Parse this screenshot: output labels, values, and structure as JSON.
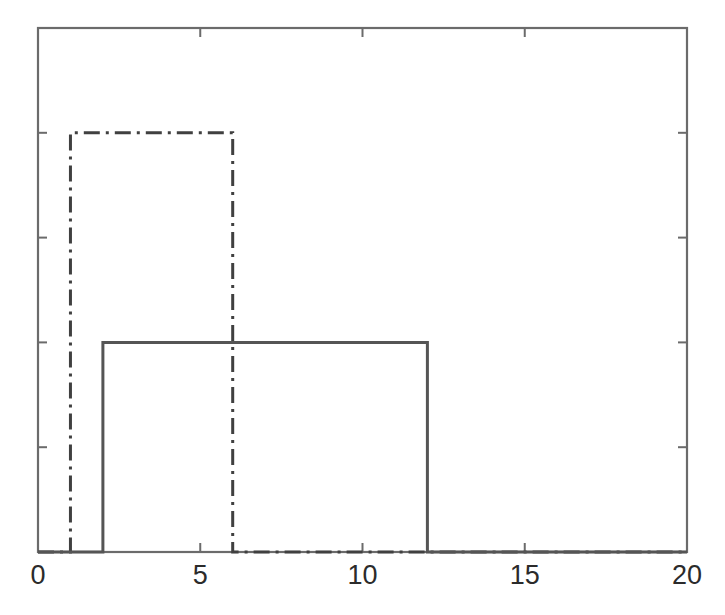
{
  "chart_data": {
    "type": "line",
    "title": "",
    "subtitle": "",
    "xlabel": "",
    "ylabel": "",
    "xlim": [
      0,
      20
    ],
    "ylim": [
      0,
      0.25
    ],
    "grid": false,
    "legend": null,
    "x_ticks": [
      0,
      5,
      10,
      15,
      20
    ],
    "x_tick_labels": [
      "0",
      "5",
      "10",
      "15",
      "20"
    ],
    "y_ticks": [
      0.05,
      0.1,
      0.15,
      0.2
    ],
    "y_tick_labels": [
      "",
      "",
      "",
      ""
    ],
    "series": [
      {
        "name": "uniform-1-6",
        "style": "dash-dot",
        "color": "#404040",
        "linewidth": 3,
        "description": "Uniform density on [1, 6], height 0.2",
        "x": [
          0,
          1,
          1,
          6,
          6,
          20
        ],
        "values": [
          0,
          0,
          0.2,
          0.2,
          0,
          0
        ],
        "support": [
          1,
          6
        ],
        "height": 0.2
      },
      {
        "name": "uniform-2-12",
        "style": "solid",
        "color": "#555555",
        "linewidth": 3,
        "description": "Uniform density on [2, 12], height 0.1",
        "x": [
          0,
          2,
          2,
          12,
          12,
          20
        ],
        "values": [
          0,
          0,
          0.1,
          0.1,
          0,
          0
        ],
        "support": [
          2,
          12
        ],
        "height": 0.1
      }
    ]
  },
  "axes": {
    "frame_color": "#6b6b6b",
    "tick_color": "#6b6b6b",
    "background": "#ffffff"
  }
}
